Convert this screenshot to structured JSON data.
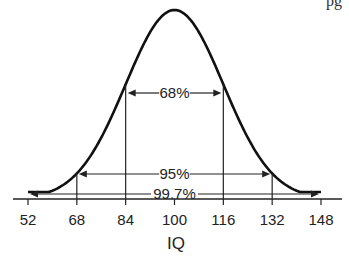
{
  "corner_text": "pg",
  "chart_data": {
    "type": "line",
    "title": "",
    "xlabel": "IQ",
    "ylabel": "",
    "mean": 100,
    "std_dev": 16,
    "x_ticks": [
      52,
      68,
      84,
      100,
      116,
      132,
      148
    ],
    "xlim": [
      52,
      148
    ],
    "grid": false,
    "legend": "none",
    "intervals": [
      {
        "label": "68%",
        "from": 84,
        "to": 116
      },
      {
        "label": "95%",
        "from": 68,
        "to": 132
      },
      {
        "label": "99.7%",
        "from": 52,
        "to": 148
      }
    ]
  }
}
